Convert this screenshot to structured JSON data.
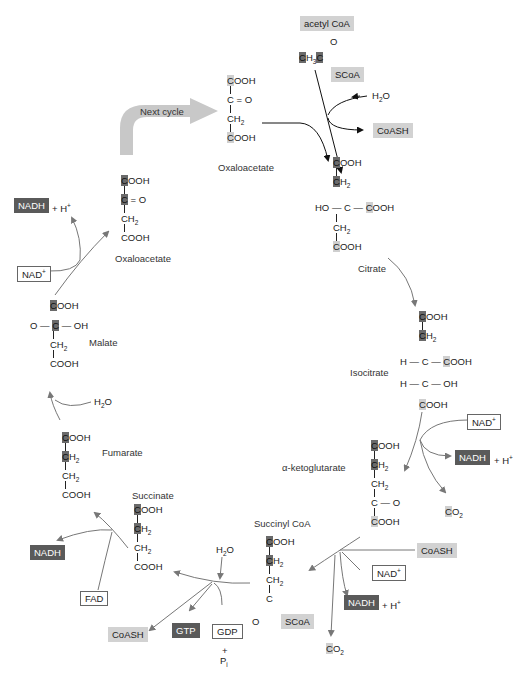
{
  "diagram": {
    "next_cycle_label": "Next cycle",
    "colors": {
      "dark_box": "#5a5a5a",
      "light_box": "#d2d2d2",
      "arrow_gray": "#777777",
      "arrow_black": "#111111",
      "next_cycle_arrow": "#c8c8c8"
    },
    "molecules": {
      "oxaloacetate_top": {
        "name": "Oxaloacetate",
        "lines": [
          "COOH",
          "C = O",
          "CH2",
          "COOH"
        ]
      },
      "acetyl_coa": {
        "name": "acetyl CoA",
        "formula": "CH3C",
        "o": "O",
        "scoa": "SCoA"
      },
      "citrate": {
        "name": "Citrate",
        "lines": [
          "COOH",
          "CH2",
          "HO — C — COOH",
          "CH2",
          "COOH"
        ]
      },
      "isocitrate": {
        "name": "Isocitrate",
        "lines": [
          "COOH",
          "CH2",
          "H — C — COOH",
          "H — C — OH",
          "COOH"
        ]
      },
      "alpha_ketoglutarate": {
        "name": "α-ketoglutarate",
        "lines": [
          "COOH",
          "CH2",
          "CH2",
          "C — O",
          "COOH"
        ]
      },
      "succinyl_coa": {
        "name": "Succinyl CoA",
        "lines": [
          "COOH",
          "CH2",
          "CH2",
          "C",
          "O",
          "SCoA"
        ]
      },
      "succinate": {
        "name": "Succinate",
        "lines": [
          "COOH",
          "CH2",
          "CH2",
          "COOH"
        ]
      },
      "fumarate": {
        "name": "Fumarate",
        "lines": [
          "COOH",
          "CH2",
          "CH2",
          "COOH"
        ]
      },
      "malate": {
        "name": "Malate",
        "lines": [
          "COOH",
          "O — C — OH",
          "CH2",
          "COOH"
        ]
      },
      "oxaloacetate_left": {
        "name": "Oxaloacetate",
        "lines": [
          "COOH",
          "C = O",
          "CH2",
          "COOH"
        ]
      }
    },
    "cofactors": {
      "h2o_citrate": "H2O",
      "coash_citrate": "CoASH",
      "nad_isocitrate": "NAD+",
      "nadh_isocitrate": "NADH",
      "h_isocitrate": "+ H+",
      "co2_isocitrate": "CO2",
      "coash_akg": "CoASH",
      "nad_akg": "NAD+",
      "nadh_akg": "NADH",
      "h_akg": "+ H+",
      "co2_akg": "CO2",
      "h2o_succinyl": "H2O",
      "coash_succinyl": "CoASH",
      "gtp": "GTP",
      "gdp": "GDP",
      "plus": "+",
      "pi": "Pi",
      "fad": "FAD",
      "nadh_succinate": "NADH",
      "h2o_fumarate": "H2O",
      "nad_malate": "NAD+",
      "nadh_malate": "NADH",
      "h_malate": "+ H+"
    }
  }
}
